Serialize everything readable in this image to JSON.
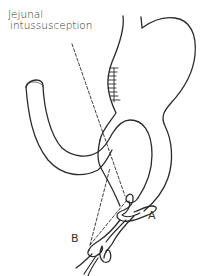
{
  "diagram": {
    "annotation": {
      "line1": "Jejunal",
      "line2": "intussusception"
    },
    "labels": {
      "a": "A",
      "b": "B"
    },
    "structures": [
      "stomach",
      "afferent-jejunal-loop",
      "efferent-jejunal-loop",
      "gastrojejunostomy-suture-line",
      "intussuscepted-segment-a",
      "intussuscepted-segment-b"
    ],
    "colors": {
      "stroke": "#2b2b2b",
      "background": "#ffffff",
      "text": "#333333"
    }
  }
}
